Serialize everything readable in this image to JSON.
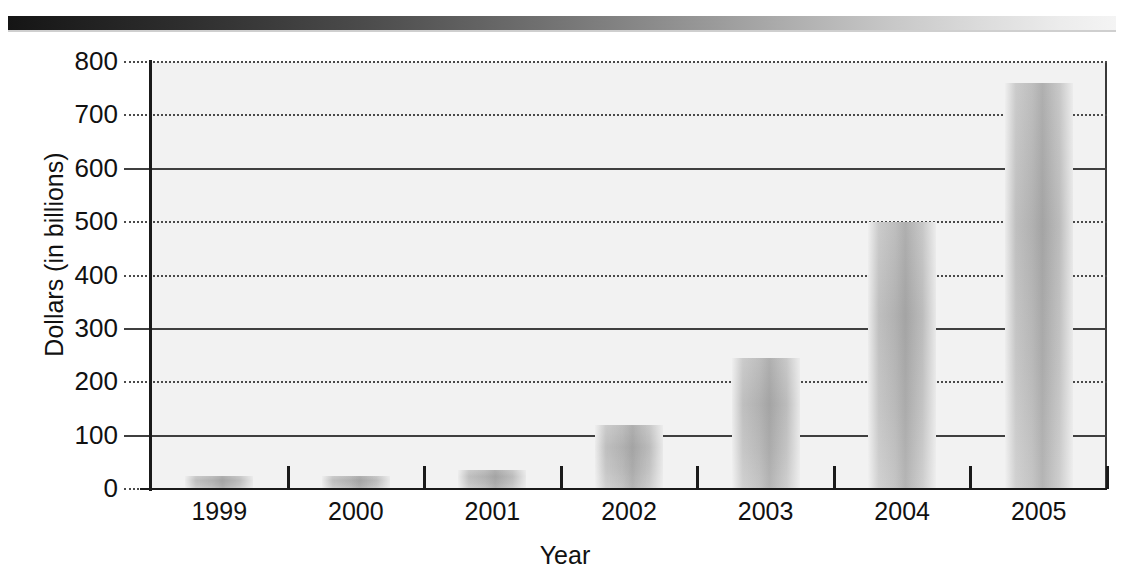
{
  "decor": {
    "top_band_colors": {
      "start": "#151515",
      "end": "#f4f4f4"
    }
  },
  "chart_data": {
    "type": "bar",
    "title": "",
    "xlabel": "Year",
    "ylabel": "Dollars (in billions)",
    "categories": [
      "1999",
      "2000",
      "2001",
      "2002",
      "2003",
      "2004",
      "2005"
    ],
    "values": [
      25,
      25,
      35,
      120,
      245,
      500,
      760
    ],
    "ylim": [
      0,
      800
    ],
    "ytick_labels": [
      "800",
      "700",
      "600",
      "500",
      "400",
      "300",
      "200",
      "100",
      "0"
    ],
    "ytick_values": [
      800,
      700,
      600,
      500,
      400,
      300,
      200,
      100,
      0
    ],
    "ystep": 100,
    "grid": true,
    "legend": "none",
    "bar_color": "#b8b8b8",
    "axis_color": "#1a1a1a",
    "plot_background": "#f2f2f2"
  }
}
